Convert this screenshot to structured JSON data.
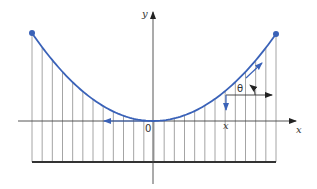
{
  "diagram": {
    "type": "catenary-cable-with-hangers",
    "labels": {
      "y_axis": "y",
      "x_axis": "x",
      "origin": "0",
      "point_x": "x",
      "angle": "θ"
    },
    "colors": {
      "curve": "#3a62b8",
      "endpoint": "#3a62b8",
      "axes": "#333333",
      "hangers": "#999999",
      "deck": "#333333",
      "arrow_accent": "#3a62b8"
    },
    "elements": [
      "parabolic cable curve with endpoints",
      "vertical hangers",
      "horizontal deck line",
      "x and y axes",
      "tangent angle theta at point x",
      "downward load arrow at x",
      "leftward tension arrow at vertex"
    ]
  }
}
